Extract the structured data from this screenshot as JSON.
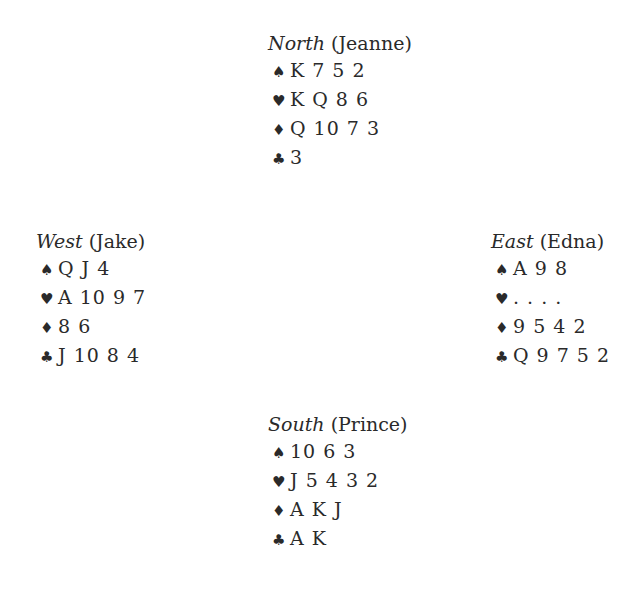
{
  "suit_symbols": {
    "spades": "♠",
    "hearts": "♥",
    "diamonds": "♦",
    "clubs": "♣"
  },
  "hands": {
    "north": {
      "direction": "North",
      "player": "(Jeanne)",
      "spades": "K 7 5 2",
      "hearts": "K Q 8 6",
      "diamonds": "Q 10 7 3",
      "clubs": "3"
    },
    "west": {
      "direction": "West",
      "player": "(Jake)",
      "spades": "Q J 4",
      "hearts": "A 10 9 7",
      "diamonds": "8 6",
      "clubs": "J 10 8 4"
    },
    "east": {
      "direction": "East",
      "player": "(Edna)",
      "spades": "A 9 8",
      "hearts": ". . . .",
      "diamonds": "9 5 4 2",
      "clubs": "Q 9 7 5 2"
    },
    "south": {
      "direction": "South",
      "player": "(Prince)",
      "spades": "10 6 3",
      "hearts": "J 5 4 3 2",
      "diamonds": "A K J",
      "clubs": "A K"
    }
  }
}
